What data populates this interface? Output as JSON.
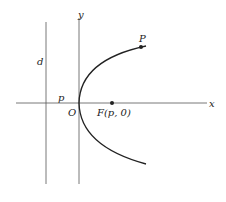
{
  "diagram": {
    "type": "parabola",
    "labels": {
      "y_axis": "y",
      "x_axis": "x",
      "directrix": "d",
      "distance": "p",
      "origin": "O",
      "focus": "F(p, 0)",
      "point": "P"
    },
    "colors": {
      "stroke": "#333333",
      "curve": "#222222",
      "background": "#ffffff"
    }
  }
}
